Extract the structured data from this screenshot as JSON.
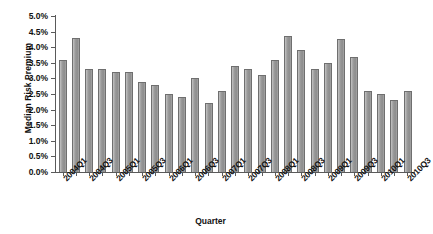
{
  "chart_data": {
    "type": "bar",
    "title": "",
    "xlabel": "Quarter",
    "ylabel": "Median Risk Premium",
    "ylim": [
      0.0,
      5.0
    ],
    "ytick_step": 0.5,
    "ytick_labels": [
      "0.0%",
      "0.5%",
      "1.0%",
      "1.5%",
      "2.0%",
      "2.5%",
      "3.0%",
      "3.5%",
      "4.0%",
      "4.5%",
      "5.0%"
    ],
    "ytick_values": [
      0.0,
      0.5,
      1.0,
      1.5,
      2.0,
      2.5,
      3.0,
      3.5,
      4.0,
      4.5,
      5.0
    ],
    "grid": false,
    "legend": "none",
    "xtick_label_rotation": -45,
    "xtick_label_interval": 2,
    "categories": [
      "2004Q1",
      "2004Q2",
      "2004Q3",
      "2004Q4",
      "2005Q1",
      "2005Q2",
      "2005Q3",
      "2005Q4",
      "2006Q1",
      "2006Q2",
      "2006Q3",
      "2006Q4",
      "2007Q1",
      "2007Q2",
      "2007Q3",
      "2007Q4",
      "2008Q1",
      "2008Q2",
      "2008Q3",
      "2008Q4",
      "2009Q1",
      "2009Q2",
      "2009Q3",
      "2009Q4",
      "2010Q1",
      "2010Q2",
      "2010Q3"
    ],
    "visible_xtick_labels": [
      "2004Q1",
      "2004Q3",
      "2005Q1",
      "2005Q3",
      "2006Q1",
      "2006Q3",
      "2007Q1",
      "2007Q3",
      "2008Q1",
      "2008Q3",
      "2009Q1",
      "2009Q3",
      "2010Q1",
      "2010Q3"
    ],
    "values": [
      3.6,
      4.3,
      3.3,
      3.3,
      3.2,
      3.2,
      2.9,
      2.8,
      2.5,
      2.4,
      3.0,
      2.2,
      2.6,
      3.4,
      3.3,
      3.1,
      3.6,
      4.35,
      3.9,
      3.3,
      3.5,
      4.25,
      3.7,
      2.6,
      2.5,
      2.3,
      2.6
    ],
    "unit": "percent",
    "bar_color": "#9a9a9a",
    "bar_border_color": "#6f6f6f",
    "axis_color": "#5a5a5a",
    "background_color": "#ffffff",
    "text_color": "#111111"
  }
}
